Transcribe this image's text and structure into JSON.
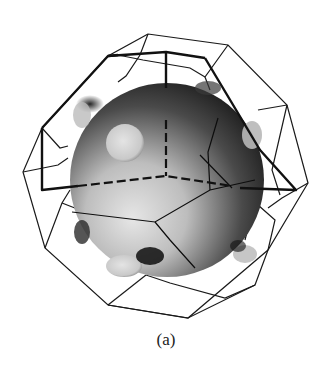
{
  "figure": {
    "caption": "(a)",
    "colors": {
      "background": "#ffffff",
      "edge": "#1a1a1a",
      "sphere_light": "#e8e8e8",
      "sphere_dark": "#151515",
      "bump": "#d9d9d9"
    }
  }
}
